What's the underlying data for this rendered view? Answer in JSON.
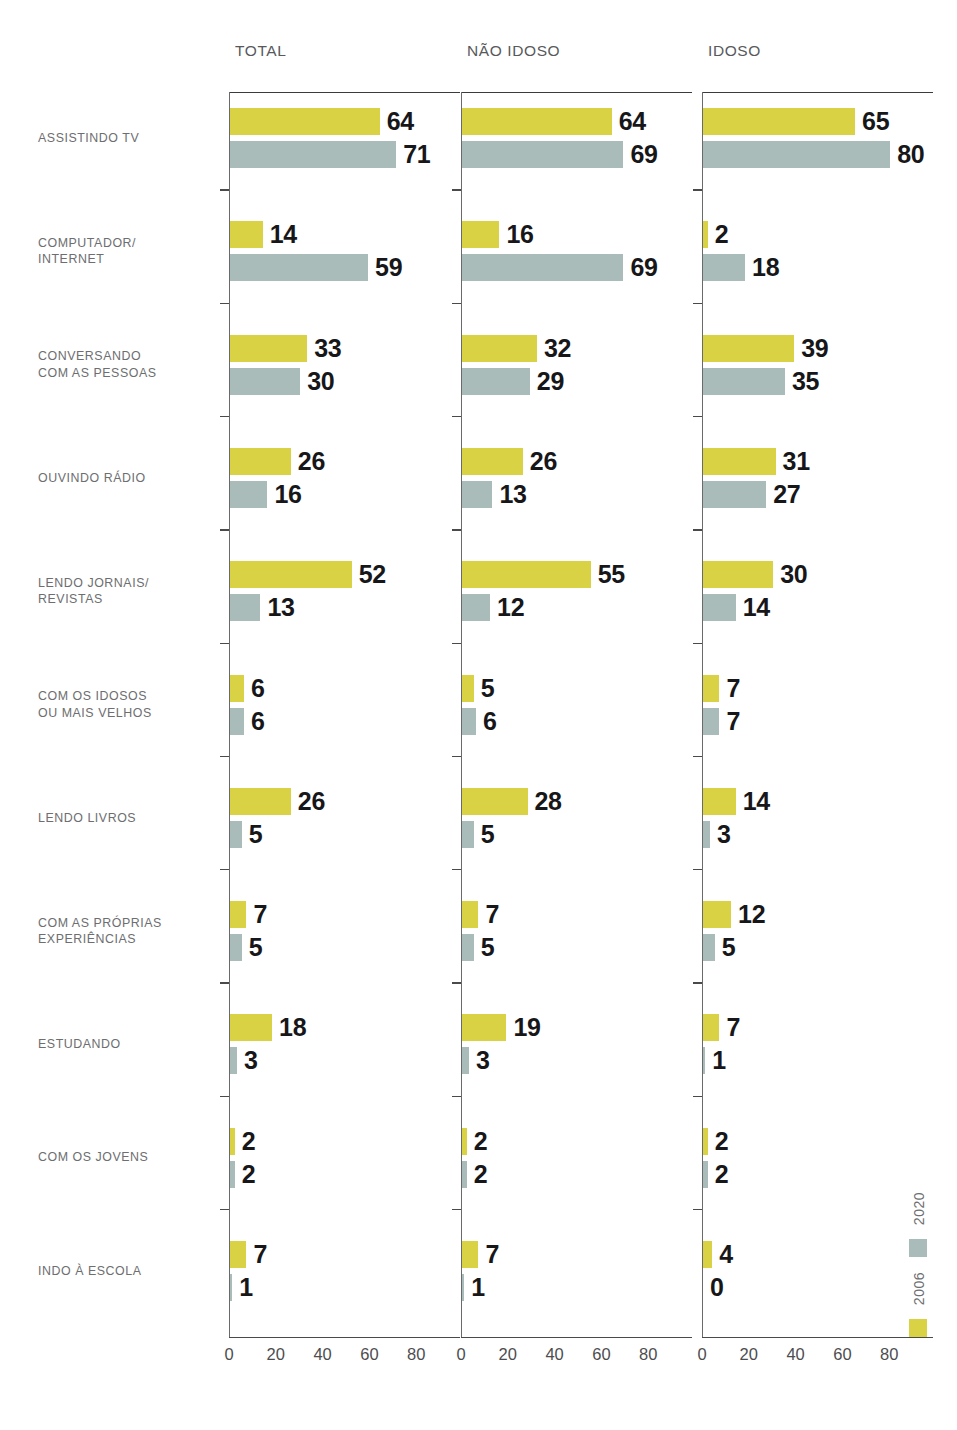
{
  "chart_data": {
    "type": "bar",
    "title": "",
    "xlabel": "",
    "ylabel": "",
    "xlim": [
      0,
      95
    ],
    "grid": false,
    "orientation": "horizontal",
    "legend_position": "bottom-right",
    "panels": [
      "TOTAL",
      "NÃO IDOSO",
      "IDOSO"
    ],
    "categories": [
      "ASSISTINDO TV",
      "COMPUTADOR/\nINTERNET",
      "CONVERSANDO\nCOM AS PESSOAS",
      "OUVINDO RÁDIO",
      "LENDO JORNAIS/\nREVISTAS",
      "COM OS IDOSOS\nOU MAIS VELHOS",
      "LENDO LIVROS",
      "COM AS PRÓPRIAS\nEXPERIÊNCIAS",
      "ESTUDANDO",
      "COM OS JOVENS",
      "INDO À ESCOLA"
    ],
    "series": [
      {
        "name": "2006",
        "color": "#d9d245"
      },
      {
        "name": "2020",
        "color": "#a9bcb9"
      }
    ],
    "xticks": [
      0,
      20,
      40,
      60,
      80
    ],
    "values": {
      "TOTAL": {
        "2006": [
          64,
          14,
          33,
          26,
          52,
          6,
          26,
          7,
          18,
          2,
          7
        ],
        "2020": [
          71,
          59,
          30,
          16,
          13,
          6,
          5,
          5,
          3,
          2,
          1
        ]
      },
      "NÃO IDOSO": {
        "2006": [
          64,
          16,
          32,
          26,
          55,
          5,
          28,
          7,
          19,
          2,
          7
        ],
        "2020": [
          69,
          69,
          29,
          13,
          12,
          6,
          5,
          5,
          3,
          2,
          1
        ]
      },
      "IDOSO": {
        "2006": [
          65,
          2,
          39,
          31,
          30,
          7,
          14,
          12,
          7,
          2,
          4
        ],
        "2020": [
          80,
          18,
          35,
          27,
          14,
          7,
          3,
          5,
          1,
          2,
          0
        ]
      }
    }
  },
  "panels": [
    {
      "title": "TOTAL"
    },
    {
      "title": "NÃO IDOSO"
    },
    {
      "title": "IDOSO"
    }
  ],
  "categories": [
    {
      "line1": "ASSISTINDO TV",
      "line2": ""
    },
    {
      "line1": "COMPUTADOR/",
      "line2": "INTERNET"
    },
    {
      "line1": "CONVERSANDO",
      "line2": "COM AS PESSOAS"
    },
    {
      "line1": "OUVINDO RÁDIO",
      "line2": ""
    },
    {
      "line1": "LENDO JORNAIS/",
      "line2": "REVISTAS"
    },
    {
      "line1": "COM OS IDOSOS",
      "line2": "OU MAIS VELHOS"
    },
    {
      "line1": "LENDO LIVROS",
      "line2": ""
    },
    {
      "line1": "COM AS PRÓPRIAS",
      "line2": "EXPERIÊNCIAS"
    },
    {
      "line1": "ESTUDANDO",
      "line2": ""
    },
    {
      "line1": "COM OS JOVENS",
      "line2": ""
    },
    {
      "line1": "INDO À ESCOLA",
      "line2": ""
    }
  ],
  "axis": {
    "ticks": [
      "0",
      "20",
      "40",
      "60",
      "80"
    ]
  },
  "legend": {
    "items": [
      {
        "label": "2020",
        "color": "#a9bcb9"
      },
      {
        "label": "2006",
        "color": "#d9d245"
      }
    ]
  }
}
